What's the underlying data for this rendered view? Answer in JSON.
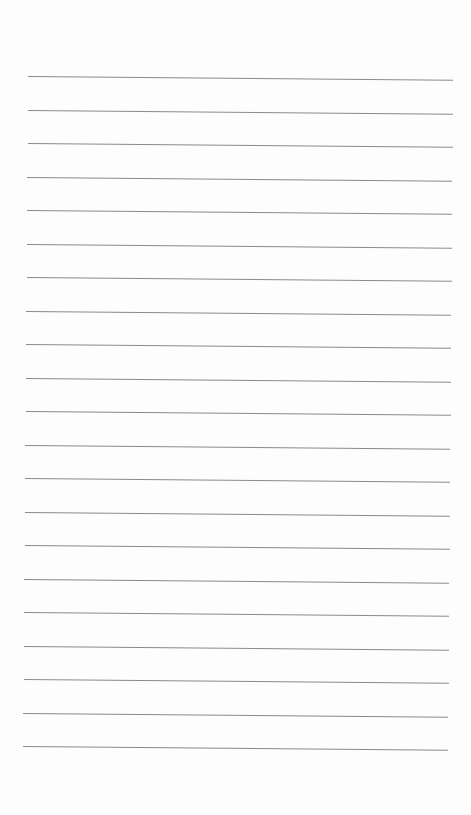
{
  "page": {
    "type": "lined-paper",
    "background": "#fdfdfd",
    "line_color": "#8a8a8a",
    "line_count": 21,
    "first_line_y": 76,
    "line_spacing": 33.5,
    "line_left_start": 28,
    "line_left_end": 23,
    "line_width": 425
  }
}
